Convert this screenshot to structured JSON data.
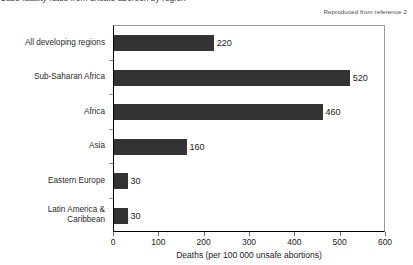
{
  "figure": {
    "caption_cropped": "Case fatality rates from unsafe abortion by region",
    "attribution": "Reproduced from reference 2"
  },
  "chart_data": {
    "type": "bar",
    "orientation": "horizontal",
    "title": "",
    "categories": [
      "All developing regions",
      "Sub-Saharan Africa",
      "Africa",
      "Asia",
      "Eastern Europe",
      "Latin America &\nCaribbean"
    ],
    "values": [
      220,
      520,
      460,
      160,
      30,
      30
    ],
    "data_labels": [
      "220",
      "520",
      "460",
      "160",
      "30",
      "30"
    ],
    "xlabel": "Deaths (per 100 000 unsafe abortions)",
    "ylabel": "",
    "xlim": [
      0,
      600
    ],
    "xticks": [
      0,
      100,
      200,
      300,
      400,
      500,
      600
    ],
    "xtick_labels": [
      "0",
      "100",
      "200",
      "300",
      "400",
      "500",
      "600"
    ],
    "grid": false,
    "legend": false,
    "bar_color": "#333333",
    "axis_color": "#000000"
  }
}
